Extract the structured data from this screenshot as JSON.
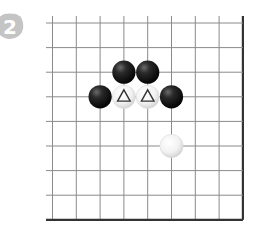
{
  "problem": {
    "number_label": "2",
    "badge_color": "#c4c4c4"
  },
  "board": {
    "visible_columns": 9,
    "visible_rows": 9,
    "edges_shown": [
      "right",
      "bottom"
    ],
    "line_color": "#8a8a8a",
    "edge_color": "#333333",
    "stones": [
      {
        "color": "black",
        "col": 3,
        "row": 2,
        "marker": null
      },
      {
        "color": "black",
        "col": 4,
        "row": 2,
        "marker": null
      },
      {
        "color": "black",
        "col": 2,
        "row": 3,
        "marker": null
      },
      {
        "color": "white",
        "col": 3,
        "row": 3,
        "marker": "triangle"
      },
      {
        "color": "white",
        "col": 4,
        "row": 3,
        "marker": "triangle"
      },
      {
        "color": "black",
        "col": 5,
        "row": 3,
        "marker": null
      },
      {
        "color": "white",
        "col": 5,
        "row": 5,
        "marker": null
      }
    ]
  }
}
